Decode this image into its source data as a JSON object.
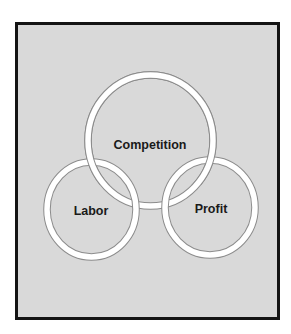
{
  "diagram": {
    "type": "interlocking-rings",
    "colors": {
      "page_background": "#ffffff",
      "frame_fill": "#d9d9d9",
      "frame_border": "#141414",
      "ring_fill": "#ffffff",
      "ring_outline": "#8c8c8c",
      "text": "#1a1a1a"
    },
    "rings": [
      {
        "id": "competition",
        "label": "Competition",
        "position": "top-center"
      },
      {
        "id": "labor",
        "label": "Labor",
        "position": "bottom-left"
      },
      {
        "id": "profit",
        "label": "Profit",
        "position": "bottom-right"
      }
    ]
  }
}
